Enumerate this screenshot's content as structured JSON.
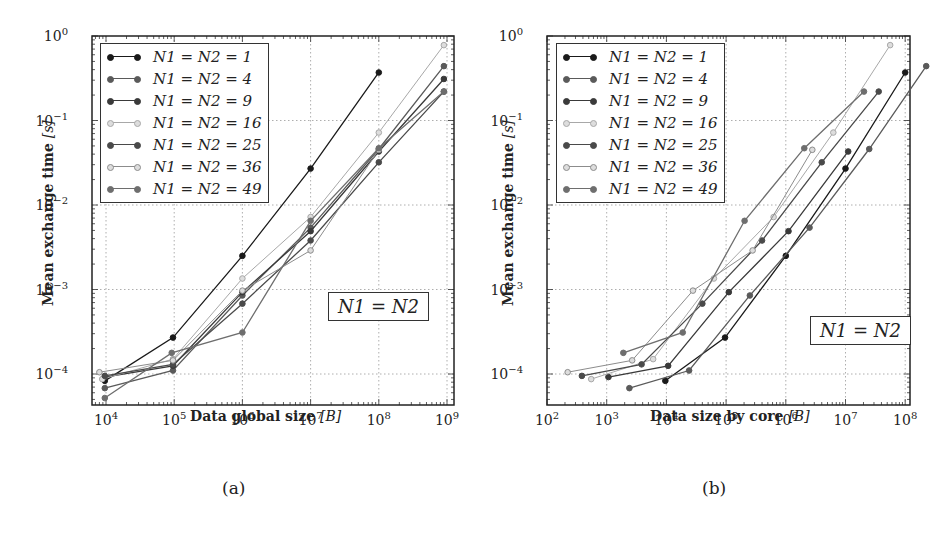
{
  "figure": {
    "captions": [
      "(a)",
      "(b)"
    ]
  },
  "chart_data": [
    {
      "type": "line",
      "panel": "(a)",
      "xscale": "log",
      "yscale": "log",
      "xlabel": "Data global size",
      "xlabel_unit": "[B]",
      "ylabel": "Mean exchange time",
      "ylabel_unit": "[s]",
      "xlim": [
        7000,
        1200000000
      ],
      "ylim": [
        3e-05,
        1
      ],
      "xticks": [
        10000,
        100000,
        1000000,
        10000000,
        100000000,
        1000000000
      ],
      "xtick_labels": [
        "10^4",
        "10^5",
        "10^6",
        "10^7",
        "10^8",
        "10^9"
      ],
      "yticks": [
        0.0001,
        0.001,
        0.01,
        0.1,
        1
      ],
      "ytick_labels": [
        "10^-4",
        "10^-3",
        "10^-2",
        "10^-1",
        "10^0"
      ],
      "grid": true,
      "legend_position": "upper left",
      "annotation": "N1 = N2",
      "series": [
        {
          "name": "N1 = N2 = 1",
          "color": "#1a1a1a",
          "hollow": false,
          "x": [
            9600,
            96000,
            1000000,
            10000000,
            100000000
          ],
          "y": [
            8.3e-05,
            0.00027,
            0.0025,
            0.027,
            0.37
          ]
        },
        {
          "name": "N1 = N2 = 4",
          "color": "#5a5a5a",
          "hollow": false,
          "x": [
            9600,
            96000,
            1000000,
            10000000,
            100000000,
            900000000
          ],
          "y": [
            6.8e-05,
            0.00011,
            0.00085,
            0.0054,
            0.046,
            0.44
          ]
        },
        {
          "name": "N1 = N2 = 9",
          "color": "#3a3a3a",
          "hollow": false,
          "x": [
            9600,
            96000,
            1000000,
            10000000,
            100000000,
            900000000
          ],
          "y": [
            9.2e-05,
            0.000125,
            0.00093,
            0.0049,
            0.043,
            0.31
          ]
        },
        {
          "name": "N1 = N2 = 16",
          "color": "#a8a8a8",
          "hollow": true,
          "x": [
            8800,
            96000,
            1000000,
            10000000,
            100000000,
            900000000
          ],
          "y": [
            8.7e-05,
            0.00015,
            0.00135,
            0.0072,
            0.072,
            0.78
          ]
        },
        {
          "name": "N1 = N2 = 25",
          "color": "#4a4a4a",
          "hollow": false,
          "x": [
            9600,
            96000,
            1000000,
            10000000,
            100000000,
            900000000
          ],
          "y": [
            9.5e-05,
            0.00013,
            0.00068,
            0.0038,
            0.032,
            0.22
          ]
        },
        {
          "name": "N1 = N2 = 36",
          "color": "#8c8c8c",
          "hollow": true,
          "x": [
            8000,
            96000,
            1000000,
            10000000,
            100000000
          ],
          "y": [
            0.000105,
            0.000145,
            0.00097,
            0.0029,
            0.045
          ]
        },
        {
          "name": "N1 = N2 = 49",
          "color": "#6e6e6e",
          "hollow": false,
          "x": [
            9600,
            92000,
            1000000,
            10000000,
            100000000,
            900000000
          ],
          "y": [
            5.2e-05,
            0.000178,
            0.00031,
            0.0065,
            0.047,
            0.22
          ]
        }
      ]
    },
    {
      "type": "line",
      "panel": "(b)",
      "xscale": "log",
      "yscale": "log",
      "xlabel": "Data size by core",
      "xlabel_unit": "[B]",
      "ylabel": "Mean exchange time",
      "ylabel_unit": "[s]",
      "xlim": [
        100,
        120000000
      ],
      "ylim": [
        3e-05,
        1
      ],
      "xticks": [
        100,
        1000,
        10000,
        100000,
        1000000,
        10000000,
        100000000
      ],
      "xtick_labels": [
        "10^2",
        "10^3",
        "10^4",
        "10^5",
        "10^6",
        "10^7",
        "10^8"
      ],
      "yticks": [
        0.0001,
        0.001,
        0.01,
        0.1,
        1
      ],
      "ytick_labels": [
        "10^-4",
        "10^-3",
        "10^-2",
        "10^-1",
        "10^0"
      ],
      "grid": true,
      "legend_position": "upper left",
      "annotation": "N1 = N2",
      "series": [
        {
          "name": "N1 = N2 = 1",
          "color": "#1a1a1a",
          "hollow": false,
          "x": [
            9600,
            96000,
            1000000,
            10000000,
            100000000
          ],
          "y": [
            8.3e-05,
            0.00027,
            0.0025,
            0.027,
            0.37
          ]
        },
        {
          "name": "N1 = N2 = 4",
          "color": "#5a5a5a",
          "hollow": false,
          "x": [
            2400,
            24000,
            250000,
            2500000,
            25000000,
            225000000
          ],
          "y": [
            6.8e-05,
            0.00011,
            0.00085,
            0.0054,
            0.046,
            0.44
          ]
        },
        {
          "name": "N1 = N2 = 9",
          "color": "#3a3a3a",
          "hollow": false,
          "x": [
            1070,
            10700,
            111000,
            1110000,
            11100000
          ],
          "y": [
            9.2e-05,
            0.000125,
            0.00093,
            0.0049,
            0.043
          ]
        },
        {
          "name": "N1 = N2 = 16",
          "color": "#a8a8a8",
          "hollow": true,
          "x": [
            550,
            6000,
            62500,
            625000,
            6250000,
            56000000
          ],
          "y": [
            8.7e-05,
            0.00015,
            0.00135,
            0.0072,
            0.072,
            0.78
          ]
        },
        {
          "name": "N1 = N2 = 25",
          "color": "#4a4a4a",
          "hollow": false,
          "x": [
            384,
            3840,
            40000,
            400000,
            4000000,
            36000000
          ],
          "y": [
            9.5e-05,
            0.00013,
            0.00068,
            0.0038,
            0.032,
            0.22
          ]
        },
        {
          "name": "N1 = N2 = 36",
          "color": "#8c8c8c",
          "hollow": true,
          "x": [
            222,
            2670,
            27800,
            278000,
            2780000
          ],
          "y": [
            0.000105,
            0.000145,
            0.00097,
            0.0029,
            0.045
          ]
        },
        {
          "name": "N1 = N2 = 49",
          "color": "#6e6e6e",
          "hollow": false,
          "x": [
            1900,
            18800,
            204000,
            2040000,
            20400000
          ],
          "y": [
            0.000178,
            0.00031,
            0.0065,
            0.047,
            0.22
          ]
        }
      ]
    }
  ]
}
